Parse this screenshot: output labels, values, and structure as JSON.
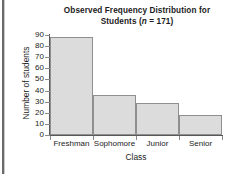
{
  "chart_data": {
    "type": "bar",
    "title": "Observed Frequency Distribution for Students (n = 171)",
    "title_line1": "Observed Frequency Distribution for",
    "title_line2_pre": "Students (",
    "title_line2_ital": "n",
    "title_line2_post": " = 171)",
    "xlabel": "Class",
    "ylabel": "Number of students",
    "categories": [
      "Freshman",
      "Sophomore",
      "Junior",
      "Senior"
    ],
    "values": [
      88,
      36,
      29,
      18
    ],
    "ylim": [
      0,
      90
    ],
    "ytick_labels": [
      "90",
      "80",
      "70",
      "60",
      "50",
      "40",
      "30",
      "20",
      "10",
      "0"
    ],
    "ytick_values": [
      90,
      80,
      70,
      60,
      50,
      40,
      30,
      20,
      10,
      0
    ],
    "ytick_step": 10,
    "grid": false,
    "legend": "none",
    "sample_size_n": 171,
    "bar_fill_color": "#dcdcdc",
    "bar_edge_color": "#8f8f8f",
    "axis_color": "#595959",
    "text_color": "#1b1b1b"
  }
}
